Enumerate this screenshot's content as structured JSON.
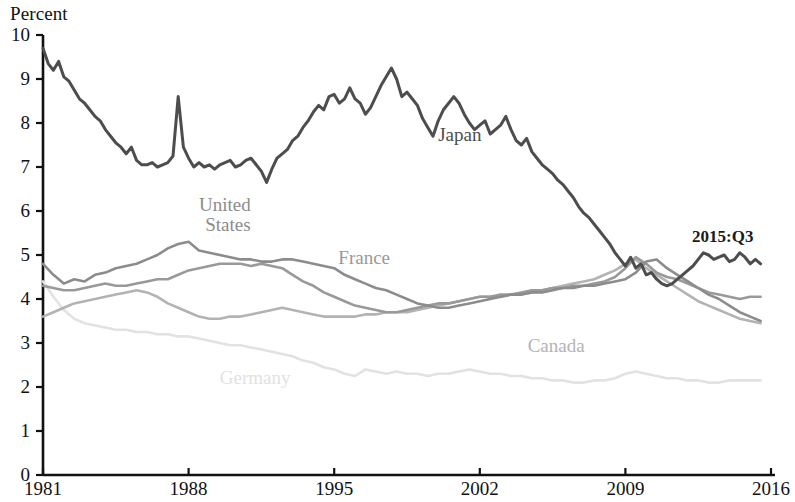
{
  "chart_data": {
    "type": "line",
    "title": "",
    "ylabel": "Percent",
    "xlabel": "",
    "ylim": [
      0,
      10
    ],
    "xlim": [
      1981,
      2016
    ],
    "yticks": [
      "0",
      "1",
      "2",
      "3",
      "4",
      "5",
      "6",
      "7",
      "8",
      "9",
      "10"
    ],
    "xticks": [
      "1981",
      "1988",
      "1995",
      "2002",
      "2009",
      "2016"
    ],
    "grid": false,
    "legend_position": "inline-annotations",
    "annotations": [
      {
        "text": "2015:Q3",
        "x": 2013.6,
        "y": 5.45,
        "color": "#1a1a1a"
      }
    ],
    "series": [
      {
        "name": "Japan",
        "color": "#4d4d4d",
        "label_x": 2000.0,
        "label_y": 7.75,
        "x": [
          1981.0,
          1981.25,
          1981.5,
          1981.75,
          1982.0,
          1982.25,
          1982.5,
          1982.75,
          1983.0,
          1983.25,
          1983.5,
          1983.75,
          1984.0,
          1984.25,
          1984.5,
          1984.75,
          1985.0,
          1985.25,
          1985.5,
          1985.75,
          1986.0,
          1986.25,
          1986.5,
          1986.75,
          1987.0,
          1987.25,
          1987.5,
          1987.75,
          1988.0,
          1988.25,
          1988.5,
          1988.75,
          1989.0,
          1989.25,
          1989.5,
          1989.75,
          1990.0,
          1990.25,
          1990.5,
          1990.75,
          1991.0,
          1991.25,
          1991.5,
          1991.75,
          1992.0,
          1992.25,
          1992.5,
          1992.75,
          1993.0,
          1993.25,
          1993.5,
          1993.75,
          1994.0,
          1994.25,
          1994.5,
          1994.75,
          1995.0,
          1995.25,
          1995.5,
          1995.75,
          1996.0,
          1996.25,
          1996.5,
          1996.75,
          1997.0,
          1997.25,
          1997.5,
          1997.75,
          1998.0,
          1998.25,
          1998.5,
          1998.75,
          1999.0,
          1999.25,
          1999.5,
          1999.75,
          2000.0,
          2000.25,
          2000.5,
          2000.75,
          2001.0,
          2001.25,
          2001.5,
          2001.75,
          2002.0,
          2002.25,
          2002.5,
          2002.75,
          2003.0,
          2003.25,
          2003.5,
          2003.75,
          2004.0,
          2004.25,
          2004.5,
          2004.75,
          2005.0,
          2005.25,
          2005.5,
          2005.75,
          2006.0,
          2006.25,
          2006.5,
          2006.75,
          2007.0,
          2007.25,
          2007.5,
          2007.75,
          2008.0,
          2008.25,
          2008.5,
          2008.75,
          2009.0,
          2009.25,
          2009.5,
          2009.75,
          2010.0,
          2010.25,
          2010.5,
          2010.75,
          2011.0,
          2011.25,
          2011.5,
          2011.75,
          2012.0,
          2012.25,
          2012.5,
          2012.75,
          2013.0,
          2013.25,
          2013.5,
          2013.75,
          2014.0,
          2014.25,
          2014.5,
          2014.75,
          2015.0,
          2015.25,
          2015.5
        ],
        "y": [
          9.7,
          9.35,
          9.2,
          9.4,
          9.05,
          8.95,
          8.75,
          8.55,
          8.45,
          8.3,
          8.15,
          8.05,
          7.85,
          7.7,
          7.55,
          7.45,
          7.3,
          7.45,
          7.15,
          7.05,
          7.05,
          7.1,
          7.0,
          7.05,
          7.1,
          7.25,
          8.6,
          7.45,
          7.2,
          7.0,
          7.1,
          7.0,
          7.05,
          6.95,
          7.05,
          7.1,
          7.15,
          7.0,
          7.05,
          7.15,
          7.2,
          7.05,
          6.9,
          6.65,
          6.95,
          7.2,
          7.3,
          7.4,
          7.6,
          7.7,
          7.9,
          8.05,
          8.25,
          8.4,
          8.3,
          8.6,
          8.65,
          8.45,
          8.55,
          8.8,
          8.55,
          8.45,
          8.2,
          8.35,
          8.6,
          8.85,
          9.05,
          9.25,
          9.0,
          8.6,
          8.7,
          8.55,
          8.4,
          8.1,
          7.9,
          7.7,
          8.05,
          8.3,
          8.45,
          8.6,
          8.45,
          8.2,
          8.0,
          7.85,
          7.95,
          8.05,
          7.75,
          7.85,
          7.95,
          8.15,
          7.85,
          7.6,
          7.5,
          7.65,
          7.35,
          7.2,
          7.05,
          6.95,
          6.85,
          6.7,
          6.6,
          6.45,
          6.3,
          6.1,
          5.95,
          5.85,
          5.7,
          5.55,
          5.4,
          5.25,
          5.05,
          4.9,
          4.75,
          4.95,
          4.7,
          4.8,
          4.55,
          4.6,
          4.45,
          4.35,
          4.3,
          4.35,
          4.45,
          4.55,
          4.65,
          4.75,
          4.9,
          5.05,
          5.0,
          4.9,
          4.95,
          5.0,
          4.85,
          4.9,
          5.05,
          4.95,
          4.8,
          4.9,
          4.8
        ]
      },
      {
        "name": "United States",
        "color": "#8c8c8c",
        "label_x": 1988.5,
        "label_y": 6.15,
        "label_x2": 1988.8,
        "x": [
          1981.0,
          1981.5,
          1982.0,
          1982.5,
          1983.0,
          1983.5,
          1984.0,
          1984.5,
          1985.0,
          1985.5,
          1986.0,
          1986.5,
          1987.0,
          1987.5,
          1988.0,
          1988.5,
          1989.0,
          1989.5,
          1990.0,
          1990.5,
          1991.0,
          1991.5,
          1992.0,
          1992.5,
          1993.0,
          1993.5,
          1994.0,
          1994.5,
          1995.0,
          1995.5,
          1996.0,
          1996.5,
          1997.0,
          1997.5,
          1998.0,
          1998.5,
          1999.0,
          1999.5,
          2000.0,
          2000.5,
          2001.0,
          2001.5,
          2002.0,
          2002.5,
          2003.0,
          2003.5,
          2004.0,
          2004.5,
          2005.0,
          2005.5,
          2006.0,
          2006.5,
          2007.0,
          2007.5,
          2008.0,
          2008.5,
          2009.0,
          2009.5,
          2010.0,
          2010.5,
          2011.0,
          2011.5,
          2012.0,
          2012.5,
          2013.0,
          2013.5,
          2014.0,
          2014.5,
          2015.0,
          2015.5
        ],
        "y": [
          4.8,
          4.55,
          4.35,
          4.45,
          4.4,
          4.55,
          4.6,
          4.7,
          4.75,
          4.8,
          4.9,
          5.0,
          5.15,
          5.25,
          5.3,
          5.1,
          5.05,
          5.0,
          4.95,
          4.9,
          4.9,
          4.85,
          4.85,
          4.9,
          4.9,
          4.85,
          4.8,
          4.75,
          4.7,
          4.55,
          4.45,
          4.35,
          4.25,
          4.2,
          4.1,
          4.0,
          3.9,
          3.85,
          3.8,
          3.8,
          3.85,
          3.9,
          3.95,
          4.0,
          4.05,
          4.1,
          4.1,
          4.15,
          4.15,
          4.2,
          4.25,
          4.25,
          4.3,
          4.3,
          4.35,
          4.4,
          4.45,
          4.6,
          4.85,
          4.9,
          4.7,
          4.55,
          4.4,
          4.25,
          4.1,
          4.0,
          3.85,
          3.7,
          3.6,
          3.5
        ]
      },
      {
        "name": "France",
        "color": "#999999",
        "label_x": 1995.2,
        "label_y": 4.95,
        "x": [
          1981.0,
          1981.5,
          1982.0,
          1982.5,
          1983.0,
          1983.5,
          1984.0,
          1984.5,
          1985.0,
          1985.5,
          1986.0,
          1986.5,
          1987.0,
          1987.5,
          1988.0,
          1988.5,
          1989.0,
          1989.5,
          1990.0,
          1990.5,
          1991.0,
          1991.5,
          1992.0,
          1992.5,
          1993.0,
          1993.5,
          1994.0,
          1994.5,
          1995.0,
          1995.5,
          1996.0,
          1996.5,
          1997.0,
          1997.5,
          1998.0,
          1998.5,
          1999.0,
          1999.5,
          2000.0,
          2000.5,
          2001.0,
          2001.5,
          2002.0,
          2002.5,
          2003.0,
          2003.5,
          2004.0,
          2004.5,
          2005.0,
          2005.5,
          2006.0,
          2006.5,
          2007.0,
          2007.5,
          2008.0,
          2008.5,
          2009.0,
          2009.5,
          2010.0,
          2010.5,
          2011.0,
          2011.5,
          2012.0,
          2012.5,
          2013.0,
          2013.5,
          2014.0,
          2014.5,
          2015.0,
          2015.5
        ],
        "y": [
          4.3,
          4.25,
          4.2,
          4.2,
          4.25,
          4.3,
          4.35,
          4.3,
          4.3,
          4.35,
          4.4,
          4.45,
          4.45,
          4.55,
          4.65,
          4.7,
          4.75,
          4.8,
          4.8,
          4.8,
          4.75,
          4.8,
          4.75,
          4.7,
          4.55,
          4.4,
          4.3,
          4.15,
          4.05,
          3.95,
          3.85,
          3.8,
          3.75,
          3.7,
          3.7,
          3.75,
          3.8,
          3.85,
          3.9,
          3.9,
          3.95,
          4.0,
          4.05,
          4.05,
          4.1,
          4.1,
          4.15,
          4.2,
          4.2,
          4.25,
          4.25,
          4.3,
          4.3,
          4.35,
          4.4,
          4.5,
          4.7,
          4.95,
          4.8,
          4.6,
          4.5,
          4.45,
          4.35,
          4.25,
          4.15,
          4.1,
          4.05,
          4.0,
          4.05,
          4.05
        ]
      },
      {
        "name": "Canada",
        "color": "#b3b3b3",
        "label_x": 2004.3,
        "label_y": 2.95,
        "x": [
          1981.0,
          1981.5,
          1982.0,
          1982.5,
          1983.0,
          1983.5,
          1984.0,
          1984.5,
          1985.0,
          1985.5,
          1986.0,
          1986.5,
          1987.0,
          1987.5,
          1988.0,
          1988.5,
          1989.0,
          1989.5,
          1990.0,
          1990.5,
          1991.0,
          1991.5,
          1992.0,
          1992.5,
          1993.0,
          1993.5,
          1994.0,
          1994.5,
          1995.0,
          1995.5,
          1996.0,
          1996.5,
          1997.0,
          1997.5,
          1998.0,
          1998.5,
          1999.0,
          1999.5,
          2000.0,
          2000.5,
          2001.0,
          2001.5,
          2002.0,
          2002.5,
          2003.0,
          2003.5,
          2004.0,
          2004.5,
          2005.0,
          2005.5,
          2006.0,
          2006.5,
          2007.0,
          2007.5,
          2008.0,
          2008.5,
          2009.0,
          2009.5,
          2010.0,
          2010.5,
          2011.0,
          2011.5,
          2012.0,
          2012.5,
          2013.0,
          2013.5,
          2014.0,
          2014.5,
          2015.0,
          2015.5
        ],
        "y": [
          3.6,
          3.7,
          3.8,
          3.9,
          3.95,
          4.0,
          4.05,
          4.1,
          4.15,
          4.2,
          4.15,
          4.05,
          3.9,
          3.8,
          3.7,
          3.6,
          3.55,
          3.55,
          3.6,
          3.6,
          3.65,
          3.7,
          3.75,
          3.8,
          3.75,
          3.7,
          3.65,
          3.6,
          3.6,
          3.6,
          3.6,
          3.65,
          3.65,
          3.7,
          3.7,
          3.7,
          3.75,
          3.8,
          3.85,
          3.9,
          3.95,
          4.0,
          4.05,
          4.05,
          4.05,
          4.1,
          4.1,
          4.15,
          4.2,
          4.25,
          4.3,
          4.35,
          4.4,
          4.45,
          4.55,
          4.65,
          4.8,
          4.9,
          4.7,
          4.55,
          4.4,
          4.25,
          4.1,
          3.95,
          3.85,
          3.75,
          3.65,
          3.55,
          3.5,
          3.45
        ]
      },
      {
        "name": "Germany",
        "color": "#e2e2e2",
        "label_x": 1989.5,
        "label_y": 2.22,
        "x": [
          1981.0,
          1981.5,
          1982.0,
          1982.5,
          1983.0,
          1983.5,
          1984.0,
          1984.5,
          1985.0,
          1985.5,
          1986.0,
          1986.5,
          1987.0,
          1987.5,
          1988.0,
          1988.5,
          1989.0,
          1989.5,
          1990.0,
          1990.5,
          1991.0,
          1991.5,
          1992.0,
          1992.5,
          1993.0,
          1993.5,
          1994.0,
          1994.5,
          1995.0,
          1995.5,
          1996.0,
          1996.5,
          1997.0,
          1997.5,
          1998.0,
          1998.5,
          1999.0,
          1999.5,
          2000.0,
          2000.5,
          2001.0,
          2001.5,
          2002.0,
          2002.5,
          2003.0,
          2003.5,
          2004.0,
          2004.5,
          2005.0,
          2005.5,
          2006.0,
          2006.5,
          2007.0,
          2007.5,
          2008.0,
          2008.5,
          2009.0,
          2009.5,
          2010.0,
          2010.5,
          2011.0,
          2011.5,
          2012.0,
          2012.5,
          2013.0,
          2013.5,
          2014.0,
          2014.5,
          2015.0,
          2015.5
        ],
        "y": [
          4.4,
          4.05,
          3.75,
          3.55,
          3.45,
          3.4,
          3.35,
          3.3,
          3.3,
          3.25,
          3.25,
          3.2,
          3.2,
          3.15,
          3.15,
          3.1,
          3.05,
          3.0,
          2.95,
          2.95,
          2.9,
          2.85,
          2.8,
          2.75,
          2.7,
          2.6,
          2.55,
          2.45,
          2.4,
          2.3,
          2.25,
          2.4,
          2.35,
          2.3,
          2.35,
          2.3,
          2.3,
          2.25,
          2.3,
          2.3,
          2.35,
          2.4,
          2.35,
          2.3,
          2.3,
          2.25,
          2.25,
          2.2,
          2.2,
          2.15,
          2.15,
          2.1,
          2.1,
          2.15,
          2.15,
          2.2,
          2.3,
          2.35,
          2.3,
          2.25,
          2.2,
          2.2,
          2.15,
          2.15,
          2.1,
          2.1,
          2.15,
          2.15,
          2.15,
          2.15
        ]
      }
    ]
  },
  "axis": {
    "y_title": "Percent",
    "y_labels": [
      "10",
      "9",
      "8",
      "7",
      "6",
      "5",
      "4",
      "3",
      "2",
      "1",
      "0"
    ],
    "x_labels": [
      "1981",
      "1988",
      "1995",
      "2002",
      "2009",
      "2016"
    ]
  },
  "labels": {
    "japan": "Japan",
    "united_states_line1": "United",
    "united_states_line2": "States",
    "france": "France",
    "canada": "Canada",
    "germany": "Germany",
    "annotation": "2015:Q3"
  },
  "colors": {
    "japan": "#4d4d4d",
    "united_states": "#8c8c8c",
    "france": "#999999",
    "canada": "#b3b3b3",
    "germany": "#e2e2e2",
    "axis": "#111111"
  }
}
